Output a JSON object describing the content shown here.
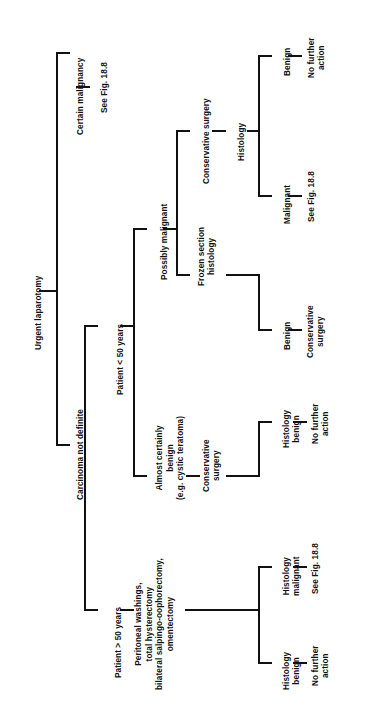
{
  "figure": {
    "type": "decision-tree-flowchart",
    "orientation": "rotated-90-ccw",
    "root": "Urgent laparotomy",
    "line_color": "#111111",
    "background_color": "#ffffff"
  },
  "nodes": {
    "root": "Urgent laparotomy",
    "certain_malignancy": "Certain malignancy",
    "certain_malignancy_action": "See Fig. 18.8",
    "carcinoma_not_definite": "Carcinoma not definite",
    "patient_under_50": "Patient < 50 years",
    "patient_over_50": "Patient > 50 years",
    "possibly_malignant": "Possibly malignant",
    "almost_certainly_benign": "Almost certainly\nbenign\n(e.g. cystic teratoma)",
    "conservative_surgery_top": "Conservative surgery",
    "frozen_section_histology": "Frozen section\nhistology",
    "histology": "Histology",
    "benign_top": "Benign",
    "no_further_action_top": "No further\naction",
    "malignant": "Malignant",
    "see_fig_malignant": "See Fig. 18.8",
    "benign_frozen": "Benign",
    "conservative_surgery_frozen": "Conservative\nsurgery",
    "conservative_surgery_benign_branch": "Conservative\nsurgery",
    "histology_benign_mid": "Histology\nbenign",
    "no_further_action_mid": "No further\naction",
    "radical_surgery": "Peritoneal washings,\ntotal hysterectomy\nbilateral salpingo-oophorectomy,\nomentectomy",
    "histology_malignant_low": "Histology\nmalignant",
    "see_fig_histology_malignant": "See Fig. 18.8",
    "histology_benign_low": "Histology\nbenign",
    "no_further_action_low": "No further\naction"
  },
  "tree": {
    "label": "Urgent laparotomy",
    "children": [
      {
        "label": "Certain malignancy",
        "children": [
          {
            "label": "See Fig. 18.8",
            "children": []
          }
        ]
      },
      {
        "label": "Carcinoma not definite",
        "children": [
          {
            "label": "Patient < 50 years",
            "children": [
              {
                "label": "Possibly malignant",
                "children": [
                  {
                    "label": "Conservative surgery",
                    "children": [
                      {
                        "label": "Histology",
                        "children": [
                          {
                            "label": "Benign",
                            "children": [
                              {
                                "label": "No further action",
                                "children": []
                              }
                            ]
                          },
                          {
                            "label": "Malignant",
                            "children": [
                              {
                                "label": "See Fig. 18.8",
                                "children": []
                              }
                            ]
                          }
                        ]
                      }
                    ]
                  },
                  {
                    "label": "Frozen section histology",
                    "children": [
                      {
                        "label": "Benign",
                        "children": [
                          {
                            "label": "Conservative surgery",
                            "children": []
                          }
                        ]
                      }
                    ]
                  }
                ]
              },
              {
                "label": "Almost certainly benign (e.g. cystic teratoma)",
                "children": [
                  {
                    "label": "Conservative surgery",
                    "children": [
                      {
                        "label": "Histology benign",
                        "children": [
                          {
                            "label": "No further action",
                            "children": []
                          }
                        ]
                      }
                    ]
                  }
                ]
              }
            ]
          },
          {
            "label": "Patient > 50 years",
            "children": [
              {
                "label": "Peritoneal washings, total hysterectomy bilateral salpingo-oophorectomy, omentectomy",
                "children": [
                  {
                    "label": "Histology malignant",
                    "children": [
                      {
                        "label": "See Fig. 18.8",
                        "children": []
                      }
                    ]
                  },
                  {
                    "label": "Histology benign",
                    "children": [
                      {
                        "label": "No further action",
                        "children": []
                      }
                    ]
                  }
                ]
              }
            ]
          }
        ]
      }
    ]
  }
}
